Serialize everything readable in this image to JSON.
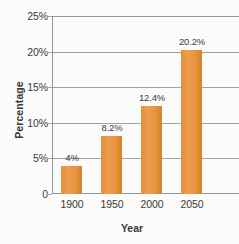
{
  "chart_data": {
    "type": "bar",
    "title": "",
    "subtitle": "",
    "xlabel": "Year",
    "ylabel": "Percentage",
    "categories": [
      "1900",
      "1950",
      "2000",
      "2050"
    ],
    "values": [
      4,
      8.2,
      12.4,
      20.2
    ],
    "data_labels": [
      "4%",
      "8.2%",
      "12.4%",
      "20.2%"
    ],
    "ylim": [
      0,
      25
    ],
    "y_ticks": [
      0,
      5,
      10,
      15,
      20,
      25
    ],
    "y_tick_labels": [
      "0",
      "5%",
      "10%",
      "15%",
      "20%",
      "25%"
    ],
    "grid": true,
    "grid_axis": "y",
    "legend": false,
    "legend_position": "none",
    "series": [
      {
        "name": "Percentage",
        "values": [
          4,
          8.2,
          12.4,
          20.2
        ]
      }
    ],
    "colors": {
      "bar_fill": "#e8923c",
      "bar_edge": "#d9812c",
      "gridline": "#9aa2aa",
      "axis": "#8f979f",
      "text": "#3a3a3a",
      "background": "#fbfbfb"
    }
  }
}
